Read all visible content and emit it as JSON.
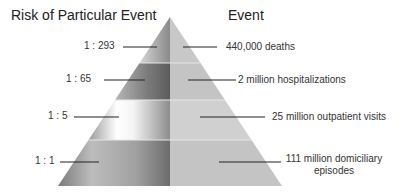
{
  "headings": {
    "left": "Risk of Particular Event",
    "right": "Event"
  },
  "tiers": [
    {
      "risk": "1 : 293",
      "event": "440,000 deaths"
    },
    {
      "risk": "1 : 65",
      "event": "2 million hospitalizations"
    },
    {
      "risk": "1 : 5",
      "event": "25 million outpatient visits"
    },
    {
      "risk": "1 : 1",
      "event": "111 million domiciliary episodes",
      "event_lines": [
        "111 million domiciliary",
        "episodes"
      ]
    }
  ],
  "colors": {
    "right_fill": "#c4c4c4",
    "line": "#222222"
  }
}
